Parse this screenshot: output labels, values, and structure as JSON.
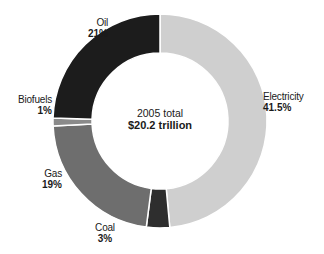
{
  "chart_data": {
    "type": "pie",
    "subtype": "donut",
    "title": "",
    "center_label": {
      "line1": "2005 total",
      "line2": "$20.2 trillion"
    },
    "categories": [
      "Electricity",
      "Coal",
      "Gas",
      "Biofuels",
      "Oil"
    ],
    "values": [
      41.5,
      3,
      19,
      1,
      21
    ],
    "unit": "%",
    "colors": [
      "#cfcfcf",
      "#2e2e2e",
      "#6e6e6e",
      "#8a8a8a",
      "#1c1c1c"
    ],
    "legend": "direct-labels"
  },
  "labels": {
    "electricity": {
      "name": "Electricity",
      "pct": "41.5%"
    },
    "coal": {
      "name": "Coal",
      "pct": "3%"
    },
    "gas": {
      "name": "Gas",
      "pct": "19%"
    },
    "biofuels": {
      "name": "Biofuels",
      "pct": "1%"
    },
    "oil": {
      "name": "Oil",
      "pct": "21%"
    }
  }
}
